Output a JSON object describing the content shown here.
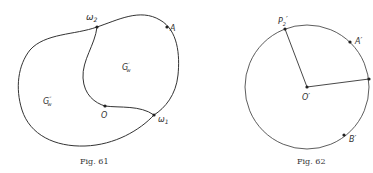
{
  "figures": [
    {
      "id": "fig61",
      "caption": "Fig. 61",
      "labels": {
        "omega2": "ω",
        "omega2_sub": "2",
        "A": "A",
        "omega1": "ω",
        "omega1_sub": "1",
        "O": "O",
        "G_prime": "G",
        "G_prime_sup": "′",
        "G_prime_sub": "w",
        "G_dprime": "G",
        "G_dprime_sup": "″",
        "G_dprime_sub": "w"
      }
    },
    {
      "id": "fig62",
      "caption": "Fig. 62",
      "labels": {
        "P2": "P",
        "P2_sub": "2",
        "P2_prime": "′",
        "A_prime": "A′",
        "O_prime": "O′",
        "B_prime": "B′"
      }
    }
  ],
  "colors": {
    "stroke": "#333333",
    "background": "#ffffff"
  }
}
